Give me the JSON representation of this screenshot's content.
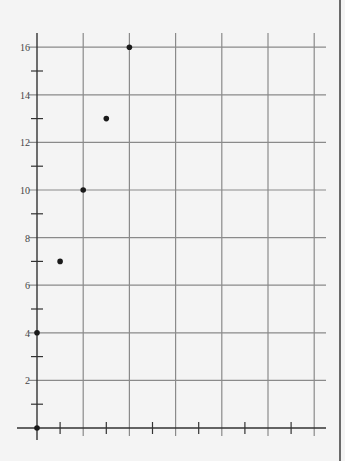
{
  "chart_data": {
    "type": "scatter",
    "title": "",
    "xlabel": "",
    "ylabel": "",
    "x": [
      0,
      0,
      1,
      2,
      3,
      4
    ],
    "y": [
      0,
      4,
      7,
      10,
      13,
      16
    ],
    "series": [
      {
        "name": "points",
        "x": [
          0,
          0,
          1,
          2,
          3,
          4
        ],
        "y": [
          0,
          4,
          7,
          10,
          13,
          16
        ]
      }
    ],
    "xlim": [
      0,
      12.5
    ],
    "ylim": [
      0,
      16.5
    ],
    "y_tick_labels": [
      "2",
      "4",
      "6",
      "8",
      "10",
      "12",
      "14",
      "16"
    ],
    "y_major_ticks": [
      2,
      4,
      6,
      8,
      10,
      12,
      14,
      16
    ],
    "y_minor_ticks": [
      1,
      3,
      5,
      7,
      9,
      11,
      13,
      15
    ],
    "x_major_gridlines": [
      2,
      4,
      6,
      8,
      10,
      12
    ],
    "x_minor_ticks": [
      1,
      3,
      5,
      7,
      9,
      11
    ],
    "x_tick_labels": [],
    "grid": true,
    "legend": null
  },
  "colors": {
    "background": "#f4f4f4",
    "grid": "#8a8a8a",
    "axis": "#333333",
    "point": "#1a1a1a",
    "label": "#444444"
  }
}
